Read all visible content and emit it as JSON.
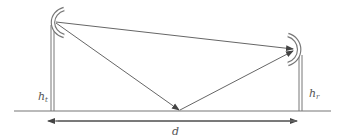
{
  "diagram": {
    "labels": {
      "transmitter_height": "h",
      "transmitter_height_sub": "t",
      "receiver_height": "h",
      "receiver_height_sub": "r",
      "distance": "d"
    },
    "colors": {
      "line": "#666666",
      "antenna": "#777777",
      "text": "#555555"
    }
  }
}
